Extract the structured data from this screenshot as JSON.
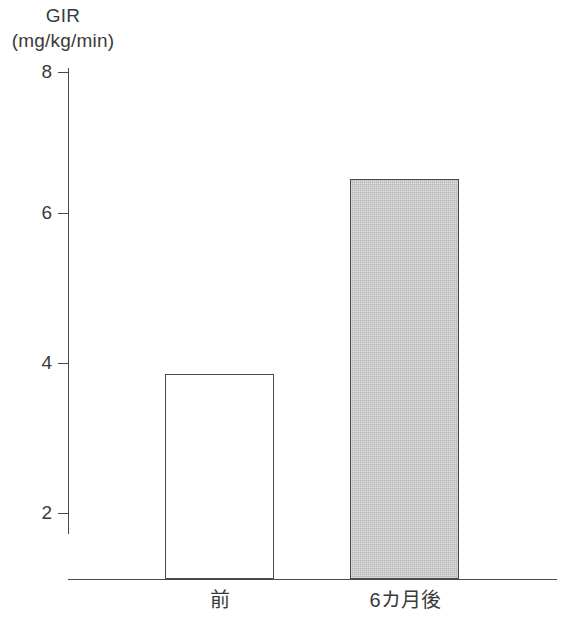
{
  "chart_data": {
    "type": "bar",
    "title": "",
    "subtitle": "",
    "xlabel": "",
    "ylabel": "GIR (mg/kg/min)",
    "ylabel_lines": [
      "GIR",
      "(mg/kg/min)"
    ],
    "categories": [
      "前",
      "6カ月後"
    ],
    "values": [
      3.85,
      6.45
    ],
    "ylim": [
      0,
      8
    ],
    "yticks": [
      8,
      6,
      4,
      2
    ],
    "ytick_labels": [
      "8",
      "6",
      "4",
      "2"
    ],
    "grid": false,
    "legend": null,
    "legend_position": "none",
    "series": [
      {
        "name": "GIR",
        "values": [
          3.85,
          6.45
        ],
        "styles": [
          "open",
          "filled"
        ]
      }
    ],
    "bar_styles": [
      {
        "category": "前",
        "fill": "#ffffff",
        "stroke": "#4a4a4a",
        "pattern": "none"
      },
      {
        "category": "6カ月後",
        "fill": "#b3b3b3",
        "stroke": "#4a4a4a",
        "pattern": "dither-gray"
      }
    ],
    "axis_color": "#4a4a4a",
    "text_color": "#3a3a3a",
    "background": "#ffffff"
  }
}
